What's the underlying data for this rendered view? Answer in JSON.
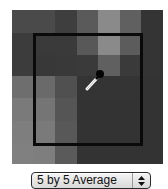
{
  "sampler": {
    "grid_size": 7,
    "cells": [
      [
        "#4a4a4a",
        "#4a4a4a",
        "#3e3e3e",
        "#5a5a5a",
        "#8a8a8a",
        "#606060",
        "#343434"
      ],
      [
        "#3c3c3c",
        "#3a3a3a",
        "#3a3a3a",
        "#585858",
        "#8a8a8a",
        "#5c5c5c",
        "#343434"
      ],
      [
        "#3c3c3c",
        "#383838",
        "#393939",
        "#3a3a3a",
        "#606060",
        "#3a3a3a",
        "#343434"
      ],
      [
        "#6e6e6e",
        "#6a6a6a",
        "#505050",
        "#343434",
        "#343434",
        "#343434",
        "#333333"
      ],
      [
        "#7a7a7a",
        "#757575",
        "#555555",
        "#333333",
        "#333333",
        "#333333",
        "#333333"
      ],
      [
        "#7e7e7e",
        "#7a7a7a",
        "#585858",
        "#333333",
        "#333333",
        "#333333",
        "#333333"
      ],
      [
        "#808080",
        "#7e7e7e",
        "#5a5a5a",
        "#333333",
        "#333333",
        "#333333",
        "#333333"
      ]
    ],
    "selection_border_color": "#0a0a0a",
    "cursor_icon": "eyedropper-icon"
  },
  "sample_size_popup": {
    "selected": "5 by 5 Average",
    "arrows_icon": "up-down-arrows-icon"
  }
}
